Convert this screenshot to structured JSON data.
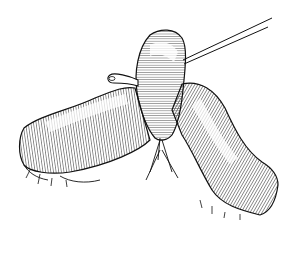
{
  "illustration": {
    "subject": "intestine-loop-with-probe",
    "colors": {
      "background": "#ffffff",
      "ink": "#111111"
    }
  }
}
